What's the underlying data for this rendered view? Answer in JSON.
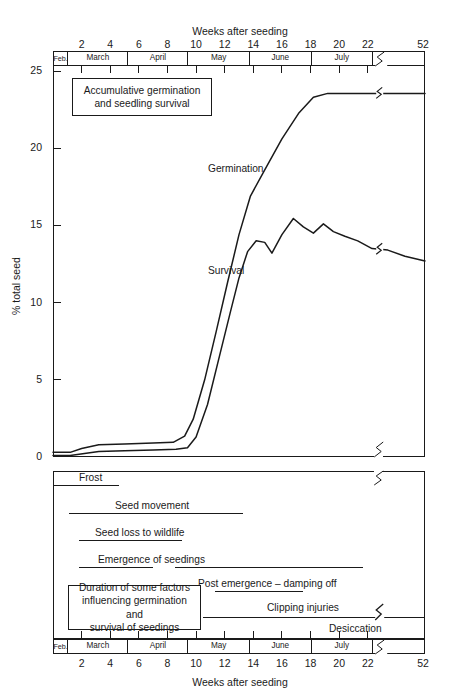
{
  "figure": {
    "caption_remnant": "",
    "top_axis_title": "Weeks after seeding",
    "bottom_axis_title": "Weeks after seeding",
    "y_axis_title": "% total seed"
  },
  "axis": {
    "week_ticks": [
      "2",
      "4",
      "6",
      "8",
      "10",
      "12",
      "14",
      "16",
      "18",
      "20",
      "22"
    ],
    "break_tick": "52",
    "y_ticks": [
      "25",
      "20",
      "15",
      "10",
      "5",
      "0"
    ],
    "months": [
      {
        "label": "Feb.",
        "start_week": 0.0,
        "end_week": 1.0
      },
      {
        "label": "March",
        "start_week": 1.0,
        "end_week": 5.2
      },
      {
        "label": "April",
        "start_week": 5.2,
        "end_week": 9.4
      },
      {
        "label": "May",
        "start_week": 9.4,
        "end_week": 13.7
      },
      {
        "label": "June",
        "start_week": 13.7,
        "end_week": 18.0
      },
      {
        "label": "July",
        "start_week": 18.0,
        "end_week": 22.3
      },
      {
        "label": "",
        "start_week": 22.3,
        "end_week": 26.0
      }
    ]
  },
  "top_panel": {
    "note_title": "Accumulative germination\nand seedling survival",
    "note_line1": "Accumulative germination",
    "note_line2": "and seedling survival",
    "germination_label": "Germination",
    "survival_label": "Survival"
  },
  "bottom_panel": {
    "note_line1": "Duration of some factors",
    "note_line2": "influencing germination and",
    "note_line3": "survival of seedings",
    "factors": [
      {
        "label": "Frost",
        "segments": [
          {
            "start": 0.0,
            "end": 4.6
          }
        ],
        "style": "solid"
      },
      {
        "label": "Seed movement",
        "segments": [
          {
            "start": 1.1,
            "end": 13.3
          }
        ],
        "style": "solid"
      },
      {
        "label": "Seed loss to wildlife",
        "segments": [
          {
            "start": 1.8,
            "end": 9.0
          }
        ],
        "style": "solid"
      },
      {
        "label": "Emergence of seedings",
        "segments": [
          {
            "start": 1.8,
            "end": 7.0
          },
          {
            "start": 8.5,
            "end": 21.7
          }
        ],
        "style": "solid"
      },
      {
        "label": "Post emergence – damping off",
        "segments": [
          {
            "start": 11.3,
            "end": 17.5
          }
        ],
        "style": "solid"
      },
      {
        "label": "Clipping injuries",
        "segments": [
          {
            "start": 10.5,
            "end": 26.0
          }
        ],
        "style": "solid"
      },
      {
        "label": "Desiccation",
        "segments": [
          {
            "start": 19.6,
            "end": 22.5
          },
          {
            "start": 23.2,
            "end": 26.0
          }
        ],
        "style": "mixed"
      }
    ]
  },
  "chart_data": {
    "type": "line",
    "title": "Accumulative germination and seedling survival",
    "xlabel": "Weeks after seeding",
    "ylabel": "% total seed",
    "xlim": [
      0,
      26
    ],
    "ylim": [
      0,
      25
    ],
    "grid": false,
    "axis_break": {
      "after_week": 22.8,
      "resumes_at_label": "52"
    },
    "x_tick_values": [
      2,
      4,
      6,
      8,
      10,
      12,
      14,
      16,
      18,
      20,
      22,
      52
    ],
    "y_tick_values": [
      0,
      5,
      10,
      15,
      20,
      25
    ],
    "series": [
      {
        "name": "Germination",
        "color": "#1a1a1a",
        "points": [
          [
            0.0,
            0.3
          ],
          [
            1.2,
            0.3
          ],
          [
            2.0,
            0.55
          ],
          [
            3.2,
            0.8
          ],
          [
            5.0,
            0.85
          ],
          [
            7.0,
            0.9
          ],
          [
            8.4,
            0.95
          ],
          [
            9.2,
            1.35
          ],
          [
            9.8,
            2.45
          ],
          [
            10.6,
            5.0
          ],
          [
            11.4,
            8.1
          ],
          [
            12.2,
            11.3
          ],
          [
            13.0,
            14.4
          ],
          [
            13.8,
            16.9
          ],
          [
            14.8,
            18.6
          ],
          [
            16.0,
            20.6
          ],
          [
            17.2,
            22.3
          ],
          [
            18.2,
            23.3
          ],
          [
            19.2,
            23.55
          ],
          [
            22.3,
            23.55
          ],
          [
            23.4,
            23.55
          ],
          [
            26.0,
            23.55
          ]
        ]
      },
      {
        "name": "Survival",
        "color": "#1a1a1a",
        "points": [
          [
            0.0,
            0.1
          ],
          [
            1.2,
            0.1
          ],
          [
            3.2,
            0.35
          ],
          [
            5.0,
            0.4
          ],
          [
            7.0,
            0.45
          ],
          [
            8.6,
            0.5
          ],
          [
            9.4,
            0.6
          ],
          [
            10.0,
            1.3
          ],
          [
            10.8,
            3.4
          ],
          [
            11.6,
            6.4
          ],
          [
            12.4,
            9.4
          ],
          [
            13.0,
            11.6
          ],
          [
            13.6,
            13.3
          ],
          [
            14.2,
            14.0
          ],
          [
            14.8,
            13.9
          ],
          [
            15.3,
            13.2
          ],
          [
            16.0,
            14.4
          ],
          [
            16.8,
            15.45
          ],
          [
            17.5,
            14.9
          ],
          [
            18.2,
            14.5
          ],
          [
            18.9,
            15.1
          ],
          [
            19.6,
            14.6
          ],
          [
            20.4,
            14.3
          ],
          [
            21.3,
            14.0
          ],
          [
            22.3,
            13.5
          ],
          [
            23.4,
            13.4
          ],
          [
            24.6,
            13.0
          ],
          [
            26.0,
            12.7
          ]
        ]
      }
    ]
  }
}
